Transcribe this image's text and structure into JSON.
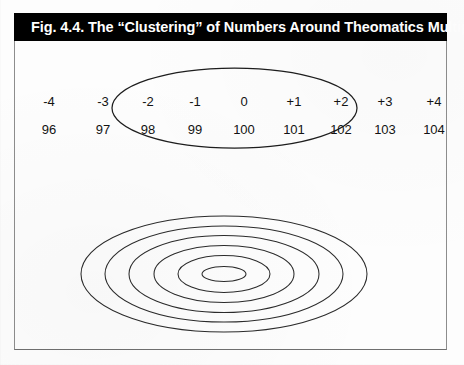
{
  "figure": {
    "title": "Fig. 4.4. The “Clustering” of Numbers Around Theomatics Multiples",
    "title_bar_color": "#000000",
    "title_text_color": "#ffffff",
    "frame_border_color": "#8d8d8d",
    "ink_color": "#2b2b2b",
    "background_color": "#fdfdfd"
  },
  "chart_data": {
    "type": "diagram",
    "title": "Fig. 4.4. The “Clustering” of Numbers Around Theomatics Multiples",
    "columns": [
      {
        "offset": "-4",
        "value": "96",
        "x": 35,
        "clustered": false
      },
      {
        "offset": "-3",
        "value": "97",
        "x": 89,
        "clustered": false
      },
      {
        "offset": "-2",
        "value": "98",
        "x": 134,
        "clustered": true
      },
      {
        "offset": "-1",
        "value": "99",
        "x": 181,
        "clustered": true
      },
      {
        "offset": "0",
        "value": "100",
        "x": 230,
        "clustered": true
      },
      {
        "offset": "+1",
        "value": "101",
        "x": 280,
        "clustered": true
      },
      {
        "offset": "+2",
        "value": "102",
        "x": 327,
        "clustered": true
      },
      {
        "offset": "+3",
        "value": "103",
        "x": 371,
        "clustered": false
      },
      {
        "offset": "+4",
        "value": "104",
        "x": 420,
        "clustered": false
      }
    ],
    "row_labels": [
      "offsets",
      "values"
    ],
    "cluster_ellipse": {
      "cx": 234.5,
      "cy": 108,
      "rx": 122.5,
      "ry": 40,
      "encloses": [
        "98",
        "99",
        "100",
        "101",
        "102"
      ]
    },
    "concentric_ellipses": {
      "cx": 224,
      "cy": 274,
      "count": 6,
      "rings": [
        {
          "rx": 143,
          "ry": 58
        },
        {
          "rx": 119,
          "ry": 48
        },
        {
          "rx": 95,
          "ry": 38.5
        },
        {
          "rx": 70,
          "ry": 28.5
        },
        {
          "rx": 46,
          "ry": 18.5
        },
        {
          "rx": 22,
          "ry": 7.5
        }
      ]
    },
    "annotations": [],
    "grid": false,
    "legend": null
  }
}
